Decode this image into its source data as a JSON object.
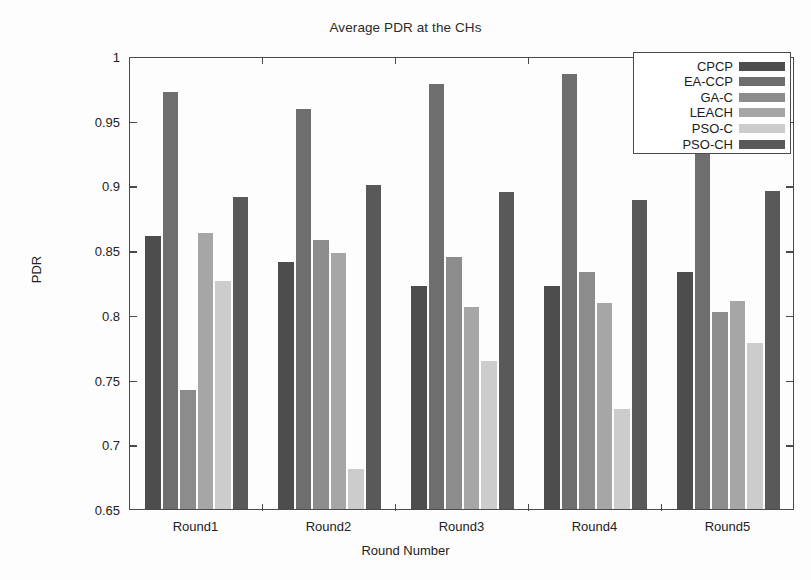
{
  "chart_data": {
    "type": "bar",
    "title": "Average PDR at the CHs",
    "xlabel": "Round Number",
    "ylabel": "PDR",
    "categories": [
      "Round1",
      "Round2",
      "Round3",
      "Round4",
      "Round5"
    ],
    "ylim": [
      0.65,
      1
    ],
    "yticks": [
      "0.65",
      "0.7",
      "0.75",
      "0.8",
      "0.85",
      "0.9",
      "0.95",
      "1"
    ],
    "ytick_values": [
      0.65,
      0.7,
      0.75,
      0.8,
      0.85,
      0.9,
      0.95,
      1.0
    ],
    "grid": false,
    "legend_position": "top-right",
    "series": [
      {
        "name": "CPCP",
        "color": "#4d4d4d",
        "values": [
          0.861,
          0.841,
          0.822,
          0.822,
          0.833
        ]
      },
      {
        "name": "EA-CCP",
        "color": "#6e6e6e",
        "values": [
          0.972,
          0.959,
          0.978,
          0.986,
          0.974
        ]
      },
      {
        "name": "GA-C",
        "color": "#8c8c8c",
        "values": [
          0.742,
          0.858,
          0.845,
          0.833,
          0.802
        ]
      },
      {
        "name": "LEACH",
        "color": "#a6a6a6",
        "values": [
          0.863,
          0.848,
          0.806,
          0.809,
          0.811
        ]
      },
      {
        "name": "PSO-C",
        "color": "#cccccc",
        "values": [
          0.826,
          0.681,
          0.764,
          0.727,
          0.778
        ]
      },
      {
        "name": "PSO-CH",
        "color": "#595959",
        "values": [
          0.891,
          0.9,
          0.895,
          0.889,
          0.896
        ]
      }
    ]
  }
}
